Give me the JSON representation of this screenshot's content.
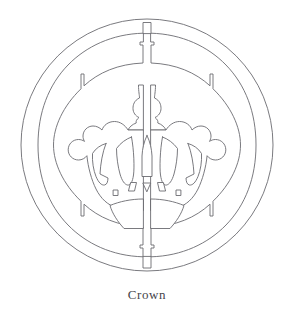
{
  "figure": {
    "title": "Crown",
    "caption": "Crown",
    "subject_icon": "crown-icon",
    "style": "line-art-stencil",
    "background_color": "#ffffff",
    "stroke_color": "#6b6b70",
    "fill_color": "#ffffff",
    "stroke_width": 0.9,
    "canvas": {
      "width": 294,
      "height": 319
    },
    "geometry": {
      "center_x": 147,
      "center_y": 145,
      "outer_ring_radius": 126,
      "inner_ring_radius": 112,
      "split_seam_x": 147,
      "top_tab_y": 22,
      "bottom_tab_y": 268
    },
    "elements": [
      {
        "name": "outer-ring",
        "shape": "circle",
        "radius": 126
      },
      {
        "name": "inner-ring",
        "shape": "split-ring",
        "radius": 112
      },
      {
        "name": "top-bridge-tab",
        "shape": "rect-tab"
      },
      {
        "name": "bottom-bridge-tab",
        "shape": "rect-tab"
      },
      {
        "name": "inner-ring-notch-top-left",
        "shape": "slot"
      },
      {
        "name": "inner-ring-notch-top-right",
        "shape": "slot"
      },
      {
        "name": "inner-ring-notch-bottom-left",
        "shape": "slot"
      },
      {
        "name": "inner-ring-notch-bottom-right",
        "shape": "slot"
      },
      {
        "name": "crown-body",
        "shape": "crown-outline"
      },
      {
        "name": "crown-center-spire",
        "shape": "orb-and-finial"
      },
      {
        "name": "crown-center-leaf",
        "shape": "pointed-leaf"
      },
      {
        "name": "crown-arch-left-inner",
        "shape": "arch"
      },
      {
        "name": "crown-arch-right-inner",
        "shape": "arch"
      },
      {
        "name": "crown-arch-left-outer",
        "shape": "arch"
      },
      {
        "name": "crown-arch-right-outer",
        "shape": "arch"
      },
      {
        "name": "crown-pearl-far-left",
        "shape": "circle"
      },
      {
        "name": "crown-pearl-left",
        "shape": "circle"
      },
      {
        "name": "crown-pearl-right",
        "shape": "circle"
      },
      {
        "name": "crown-pearl-far-right",
        "shape": "circle"
      },
      {
        "name": "crown-gem-center-triangle",
        "shape": "triangle"
      },
      {
        "name": "crown-gem-diamond-left",
        "shape": "diamond"
      },
      {
        "name": "crown-gem-diamond-right",
        "shape": "diamond"
      },
      {
        "name": "crown-gem-square-left",
        "shape": "square"
      },
      {
        "name": "crown-gem-square-right",
        "shape": "square"
      },
      {
        "name": "crown-band-left",
        "shape": "band-half"
      },
      {
        "name": "crown-band-right",
        "shape": "band-half"
      }
    ]
  }
}
